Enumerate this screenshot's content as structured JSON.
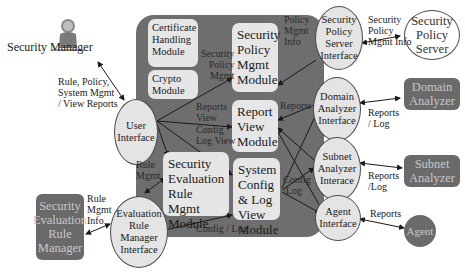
{
  "actors": {
    "security_manager": "Security Manager"
  },
  "modules": {
    "certificate": "Certificate Handling Module",
    "crypto": "Crypto Module",
    "security_policy_mgmt": "Security Policy Mgmt Module",
    "report_view": "Report View Module",
    "system_config": "System Config & Log View Module",
    "security_eval_rule": "Security Evaluation Rule Mgmt Module"
  },
  "interfaces": {
    "user": "User Interface",
    "security_policy_server": "Security Policy Server Interface",
    "domain_analyzer": "Domain Analyzer Interface",
    "subnet_analyzer": "Subnet Analyzer Interace",
    "agent": "Agent Interface",
    "evaluation_rule_manager": "Evaluation Rule Manager Interface"
  },
  "externals": {
    "security_policy_server": "Security Policy Server",
    "domain_analyzer": "Domain Analyzer",
    "subnet_analyzer": "Subnet Analyzer",
    "agent": "Agent",
    "security_evaluation_rule_manager": "Security Evaluation Rule Manager"
  },
  "edge_labels": {
    "manager_to_ui": [
      "Rule, Policy,",
      "System Mgmt",
      "/ View Reports"
    ],
    "ui_to_policy": [
      "Security",
      "Policy",
      "Mgmt"
    ],
    "ui_reports_view": [
      "Reports",
      "View"
    ],
    "ui_config": [
      "Config",
      "Log View"
    ],
    "ui_rule_mgmt": [
      "Rule",
      "Mgmt"
    ],
    "policy_info": [
      "Policy",
      "Mgmt",
      "Info"
    ],
    "sps_external": [
      "Security",
      "Policy",
      "Mgmt Info"
    ],
    "reports_right": "Reports",
    "config_log_right": [
      "Config",
      "/Log"
    ],
    "config_log_bottom": "Config / Log",
    "domain_external": [
      "Reports",
      "/ Log"
    ],
    "subnet_external": [
      "Reports",
      "/Log"
    ],
    "agent_external": "Reports",
    "rule_mgmt_info": [
      "Rule",
      "Mgmt",
      "Info"
    ]
  }
}
